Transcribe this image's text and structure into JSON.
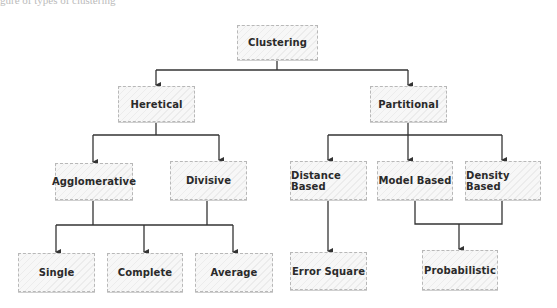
{
  "caption": "gure of types of clustering",
  "diagram": {
    "type": "tree",
    "nodes": {
      "clustering": {
        "label": "Clustering",
        "x": 237,
        "y": 25,
        "w": 81,
        "h": 35
      },
      "heretical": {
        "label": "Heretical",
        "x": 118,
        "y": 86,
        "w": 77,
        "h": 36
      },
      "partitional": {
        "label": "Partitional",
        "x": 370,
        "y": 86,
        "w": 77,
        "h": 36
      },
      "agglomerative": {
        "label": "Agglomerative",
        "x": 55,
        "y": 163,
        "w": 78,
        "h": 37
      },
      "divisive": {
        "label": "Divisive",
        "x": 170,
        "y": 161,
        "w": 77,
        "h": 39
      },
      "distance_based": {
        "label": "Distance Based",
        "x": 290,
        "y": 161,
        "w": 77,
        "h": 39
      },
      "model_based": {
        "label": "Model Based",
        "x": 377,
        "y": 161,
        "w": 76,
        "h": 39
      },
      "density_based": {
        "label": "Density Based",
        "x": 465,
        "y": 161,
        "w": 76,
        "h": 39
      },
      "single": {
        "label": "Single",
        "x": 18,
        "y": 253,
        "w": 77,
        "h": 39
      },
      "complete": {
        "label": "Complete",
        "x": 107,
        "y": 253,
        "w": 76,
        "h": 39
      },
      "average": {
        "label": "Average",
        "x": 195,
        "y": 253,
        "w": 78,
        "h": 39
      },
      "error_square": {
        "label": "Error Square",
        "x": 290,
        "y": 252,
        "w": 77,
        "h": 38
      },
      "probabilistic": {
        "label": "Probabilistic",
        "x": 422,
        "y": 250,
        "w": 76,
        "h": 40
      }
    },
    "edges": [
      [
        "clustering",
        "heretical"
      ],
      [
        "clustering",
        "partitional"
      ],
      [
        "heretical",
        "agglomerative"
      ],
      [
        "heretical",
        "divisive"
      ],
      [
        "partitional",
        "distance_based"
      ],
      [
        "partitional",
        "model_based"
      ],
      [
        "partitional",
        "density_based"
      ],
      [
        "agglomerative",
        "single"
      ],
      [
        "agglomerative",
        "complete"
      ],
      [
        "agglomerative",
        "average"
      ],
      [
        "divisive",
        "single"
      ],
      [
        "divisive",
        "complete"
      ],
      [
        "divisive",
        "average"
      ],
      [
        "distance_based",
        "error_square"
      ],
      [
        "model_based",
        "probabilistic"
      ],
      [
        "density_based",
        "probabilistic"
      ]
    ],
    "line_color": "#333333"
  }
}
